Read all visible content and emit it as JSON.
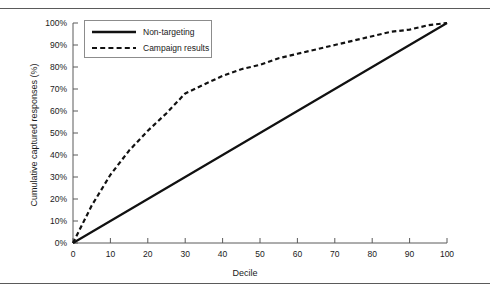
{
  "figure": {
    "top_rule": "horizontal-rule",
    "bottom_rule": "horizontal-rule"
  },
  "chart_data": {
    "type": "line",
    "title": "",
    "subtitle": "",
    "xlabel": "Decile",
    "ylabel": "Cumulative captured responses (%)",
    "xlim": [
      0,
      100
    ],
    "ylim": [
      0,
      100
    ],
    "grid": false,
    "legend_position": "top-left",
    "x_ticks": [
      0,
      10,
      20,
      30,
      40,
      50,
      60,
      70,
      80,
      90,
      100
    ],
    "x_tick_labels": [
      "0",
      "10",
      "20",
      "30",
      "40",
      "50",
      "60",
      "70",
      "80",
      "90",
      "100"
    ],
    "y_ticks": [
      0,
      10,
      20,
      30,
      40,
      50,
      60,
      70,
      80,
      90,
      100
    ],
    "y_tick_labels": [
      "0%",
      "10%",
      "20%",
      "30%",
      "40%",
      "50%",
      "60%",
      "70%",
      "80%",
      "90%",
      "100%"
    ],
    "x": [
      0,
      5,
      10,
      15,
      20,
      25,
      30,
      35,
      40,
      45,
      50,
      55,
      60,
      65,
      70,
      75,
      80,
      85,
      90,
      95,
      100
    ],
    "series": [
      {
        "name": "Non-targeting",
        "style": "solid",
        "color": "#111111",
        "values": [
          0,
          5,
          10,
          15,
          20,
          25,
          30,
          35,
          40,
          45,
          50,
          55,
          60,
          65,
          70,
          75,
          80,
          85,
          90,
          95,
          100
        ]
      },
      {
        "name": "Campaign results",
        "style": "dashed",
        "color": "#111111",
        "values": [
          0,
          17,
          31,
          42,
          51,
          59,
          68,
          72,
          76,
          79,
          81,
          84,
          86,
          88,
          90,
          92,
          94,
          96,
          97,
          99,
          100
        ]
      }
    ]
  },
  "legend": {
    "entries": [
      {
        "label": "Non-targeting",
        "style": "solid"
      },
      {
        "label": "Campaign results",
        "style": "dashed"
      }
    ]
  }
}
